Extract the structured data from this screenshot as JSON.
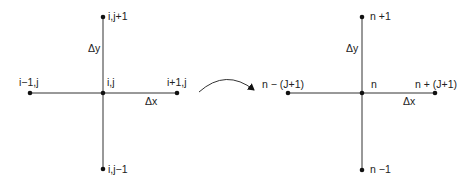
{
  "left_stencil": {
    "center": "i,j",
    "top": "i,j+1",
    "bottom": "i,j−1",
    "left": "i−1,j",
    "right": "i+1,j",
    "dy": "Δy",
    "dx": "Δx"
  },
  "right_stencil": {
    "center": "n",
    "top": "n +1",
    "bottom": "n −1",
    "left": "n − (J+1)",
    "right": "n + (J+1)",
    "dy": "Δy",
    "dx": "Δx"
  },
  "mapping_arrow": "curved-arrow"
}
